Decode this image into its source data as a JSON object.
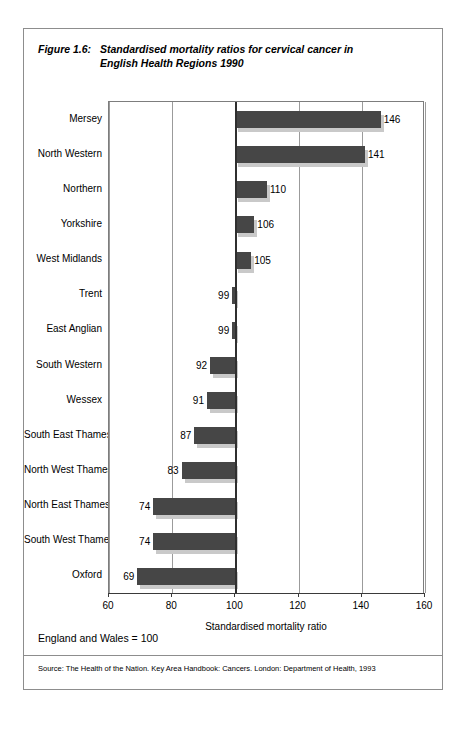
{
  "figure": {
    "number": "Figure 1.6:",
    "title_line1": "Standardised mortality ratios for cervical cancer in",
    "title_line2": "English Health  Regions 1990"
  },
  "footer": {
    "note": "England and Wales = 100",
    "source": "Source: The Health of the Nation. Key Area Handbook: Cancers. London: Department of Health, 1993"
  },
  "colors": {
    "bar_fill": "#464646",
    "bar_shadow": "#c9c9c9",
    "gridline": "#9b9b9b",
    "baseline": "#2f2f2f",
    "frame": "#8d8d8d"
  },
  "chart_data": {
    "type": "bar",
    "orientation": "horizontal",
    "title": "Standardised mortality ratios for cervical cancer in English Health  Regions 1990",
    "xlabel": "Standardised mortality ratio",
    "ylabel": "",
    "xlim": [
      60,
      160
    ],
    "xticks": [
      60,
      80,
      100,
      120,
      140,
      160
    ],
    "xticklabels": [
      "60",
      "80",
      "100",
      "120",
      "140",
      "160"
    ],
    "grid": true,
    "baseline": 100,
    "reference_note": "England and Wales = 100",
    "legend": null,
    "categories": [
      "Mersey",
      "North Western",
      "Northern",
      "Yorkshire",
      "West Midlands",
      "Trent",
      "East Anglian",
      "South Western",
      "Wessex",
      "South East Thames",
      "North West Thames",
      "North East Thames",
      "South West Thames",
      "Oxford"
    ],
    "values": [
      146,
      141,
      110,
      106,
      105,
      99,
      99,
      92,
      91,
      87,
      83,
      74,
      74,
      69
    ],
    "value_labels": [
      "146",
      "141",
      "110",
      "106",
      "105",
      "99",
      "99",
      "92",
      "91",
      "87",
      "83",
      "74",
      "74",
      "69"
    ]
  }
}
